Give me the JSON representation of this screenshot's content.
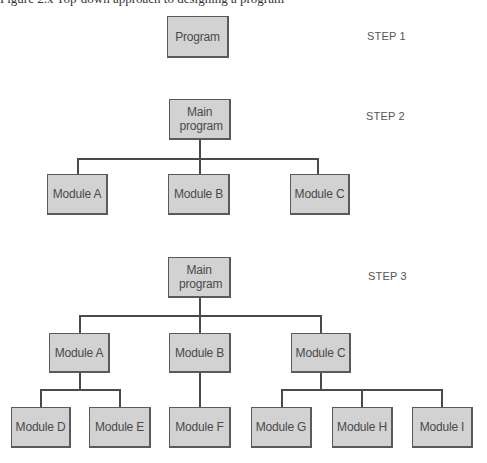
{
  "caption": "Figure 2.x  Top-down approach to designing a program",
  "steps": [
    {
      "label": "STEP 1",
      "root": "Program"
    },
    {
      "label": "STEP 2",
      "root": "Main program",
      "children": [
        "Module A",
        "Module B",
        "Module C"
      ]
    },
    {
      "label": "STEP 3",
      "root": "Main program",
      "children": [
        "Module A",
        "Module B",
        "Module C"
      ],
      "grandchildren": {
        "Module A": [
          "Module D",
          "Module E"
        ],
        "Module B": [
          "Module F"
        ],
        "Module C": [
          "Module G",
          "Module H",
          "Module I"
        ]
      },
      "leaves": [
        "Module D",
        "Module E",
        "Module F",
        "Module G",
        "Module H",
        "Module I"
      ]
    }
  ],
  "colors": {
    "box_fill": "#d2d2d2",
    "box_border": "#5a5a5a",
    "connector": "#4a4a4a"
  }
}
